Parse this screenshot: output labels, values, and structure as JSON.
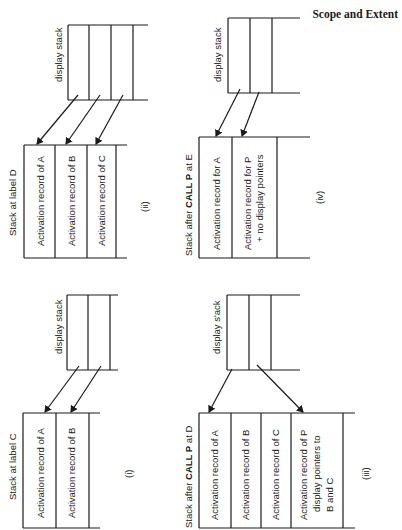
{
  "header": {
    "section_title": "Scope and Extent"
  },
  "panels": {
    "i": {
      "caption": "(i)",
      "title": "Stack at label C",
      "stack_records": [
        "Activation record of A",
        "Activation record of B"
      ],
      "display_label": "display stack"
    },
    "ii": {
      "caption": "(ii)",
      "title": "Stack at label D",
      "stack_records": [
        "Activation record of A",
        "Activation record of B",
        "Activation record of C"
      ],
      "display_label": "display stack"
    },
    "iii": {
      "caption": "(iii)",
      "title_prefix": "Stack after ",
      "title_bold": "CALL P",
      "title_suffix": " at D",
      "stack_records": [
        "Activation record of A",
        "Activation record of B",
        "Activation record of C"
      ],
      "record_p": [
        "Activation record of P",
        "display pointers to",
        "B and C"
      ],
      "display_label": "display s'ack"
    },
    "iv": {
      "caption": "(iv)",
      "title_prefix": "Stack after ",
      "title_bold": "CALL P",
      "title_suffix": " at E",
      "record_a": "Activation record for A",
      "record_p": [
        "Activation record for P",
        "+ no display pointers"
      ],
      "display_label": "display stack"
    }
  },
  "colors": {
    "ink": "#1a1a1a",
    "background": "#ffffff"
  }
}
